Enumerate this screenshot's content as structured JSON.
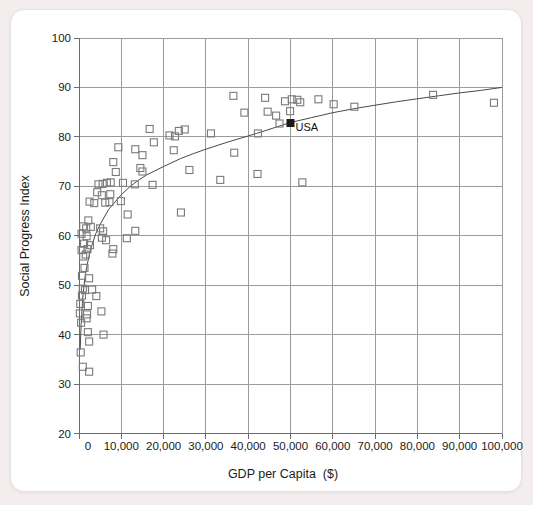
{
  "page": {
    "background_color": "#f3eded",
    "card_color": "#ffffff"
  },
  "chart_data": {
    "type": "scatter",
    "title": "",
    "xlabel": "GDP per Capita  ($)",
    "ylabel": "Social Progress Index",
    "xlim": [
      0,
      100000
    ],
    "ylim": [
      20,
      100
    ],
    "grid": true,
    "x_ticks": {
      "values": [
        0,
        10000,
        20000,
        30000,
        40000,
        50000,
        60000,
        70000,
        80000,
        90000,
        100000
      ],
      "labels": [
        "0",
        "10,000",
        "20,000",
        "30,000",
        "40,000",
        "50,000",
        "60,000",
        "70,000",
        "80,000",
        "90,000",
        "100,000"
      ]
    },
    "y_ticks": {
      "values": [
        20,
        30,
        40,
        50,
        60,
        70,
        80,
        90,
        100
      ],
      "labels": [
        "20",
        "30",
        "40",
        "50",
        "60",
        "70",
        "80",
        "90",
        "100"
      ]
    },
    "colors": {
      "grid": "#9b9b9b",
      "axis": "#6b6b6b",
      "marker_outline": "#7a7a7a",
      "curve": "#4a4a4a",
      "usa_marker": "#1a1a1a",
      "text": "#1b1b1b"
    },
    "series": [
      {
        "name": "countries",
        "marker": "open-square",
        "points": [
          [
            900,
            33.5
          ],
          [
            2400,
            32.5
          ],
          [
            400,
            36.4
          ],
          [
            2400,
            38.6
          ],
          [
            2100,
            40.5
          ],
          [
            5800,
            40.0
          ],
          [
            500,
            42.4
          ],
          [
            1800,
            43.3
          ],
          [
            200,
            44.3
          ],
          [
            1900,
            44.1
          ],
          [
            5300,
            44.7
          ],
          [
            300,
            46.2
          ],
          [
            2100,
            45.8
          ],
          [
            700,
            47.9
          ],
          [
            4100,
            47.8
          ],
          [
            900,
            49.3
          ],
          [
            1400,
            49.0
          ],
          [
            3100,
            49.1
          ],
          [
            700,
            51.9
          ],
          [
            2400,
            51.4
          ],
          [
            1300,
            53.5
          ],
          [
            1600,
            56.2
          ],
          [
            1000,
            55.8
          ],
          [
            600,
            57.1
          ],
          [
            2000,
            57.3
          ],
          [
            8100,
            57.3
          ],
          [
            7900,
            56.4
          ],
          [
            1200,
            58.4
          ],
          [
            2600,
            58.1
          ],
          [
            1800,
            59.9
          ],
          [
            5400,
            59.6
          ],
          [
            6400,
            59.1
          ],
          [
            600,
            60.4
          ],
          [
            1000,
            61.9
          ],
          [
            1700,
            61.5
          ],
          [
            2800,
            61.8
          ],
          [
            5000,
            61.5
          ],
          [
            5700,
            60.9
          ],
          [
            11300,
            59.5
          ],
          [
            13300,
            61.0
          ],
          [
            2200,
            63.1
          ],
          [
            11500,
            64.3
          ],
          [
            24100,
            64.7
          ],
          [
            2500,
            66.9
          ],
          [
            3600,
            66.6
          ],
          [
            6200,
            66.7
          ],
          [
            7200,
            66.8
          ],
          [
            9900,
            67.0
          ],
          [
            4300,
            68.8
          ],
          [
            5400,
            68.2
          ],
          [
            7400,
            68.4
          ],
          [
            4600,
            70.4
          ],
          [
            5600,
            70.5
          ],
          [
            6600,
            70.7
          ],
          [
            7500,
            70.8
          ],
          [
            10400,
            70.7
          ],
          [
            13200,
            70.4
          ],
          [
            17400,
            70.3
          ],
          [
            52800,
            70.8
          ],
          [
            33400,
            71.3
          ],
          [
            42200,
            72.5
          ],
          [
            8700,
            72.9
          ],
          [
            15000,
            73.0
          ],
          [
            26100,
            73.3
          ],
          [
            14500,
            73.7
          ],
          [
            8100,
            74.9
          ],
          [
            15000,
            76.3
          ],
          [
            36700,
            76.8
          ],
          [
            22400,
            77.3
          ],
          [
            13300,
            77.5
          ],
          [
            9300,
            77.9
          ],
          [
            17700,
            78.9
          ],
          [
            21400,
            80.3
          ],
          [
            22700,
            80.1
          ],
          [
            31200,
            80.7
          ],
          [
            42300,
            80.7
          ],
          [
            23600,
            81.2
          ],
          [
            25000,
            81.5
          ],
          [
            16700,
            81.6
          ],
          [
            47400,
            82.7
          ],
          [
            44600,
            85.1
          ],
          [
            46600,
            84.3
          ],
          [
            39100,
            84.9
          ],
          [
            49900,
            85.2
          ],
          [
            60200,
            86.6
          ],
          [
            65100,
            86.1
          ],
          [
            48700,
            87.2
          ],
          [
            50300,
            87.6
          ],
          [
            51600,
            87.5
          ],
          [
            52300,
            87.0
          ],
          [
            56600,
            87.6
          ],
          [
            36500,
            88.3
          ],
          [
            44000,
            87.9
          ],
          [
            83700,
            88.5
          ],
          [
            98100,
            86.9
          ]
        ]
      },
      {
        "name": "USA",
        "marker": "filled-square",
        "label": "USA",
        "points": [
          [
            50000,
            82.8
          ]
        ]
      }
    ],
    "trend_curve": {
      "name": "log-fit-curve",
      "points": [
        [
          280,
          37.0
        ],
        [
          500,
          42.0
        ],
        [
          800,
          46.3
        ],
        [
          1000,
          48.5
        ],
        [
          1500,
          52.0
        ],
        [
          2000,
          54.5
        ],
        [
          3000,
          58.0
        ],
        [
          4000,
          60.5
        ],
        [
          5000,
          62.3
        ],
        [
          7000,
          65.3
        ],
        [
          10000,
          68.3
        ],
        [
          12000,
          69.9
        ],
        [
          14000,
          71.2
        ],
        [
          16000,
          72.3
        ],
        [
          20000,
          74.0
        ],
        [
          24000,
          75.6
        ],
        [
          27000,
          76.6
        ],
        [
          30000,
          77.5
        ],
        [
          35000,
          78.9
        ],
        [
          42000,
          80.7
        ],
        [
          50000,
          82.9
        ],
        [
          55000,
          83.9
        ],
        [
          60000,
          84.9
        ],
        [
          65000,
          85.7
        ],
        [
          70000,
          86.4
        ],
        [
          75000,
          87.1
        ],
        [
          80000,
          87.7
        ],
        [
          85000,
          88.3
        ],
        [
          90000,
          88.9
        ],
        [
          95000,
          89.4
        ],
        [
          100000,
          90.0
        ]
      ]
    }
  }
}
